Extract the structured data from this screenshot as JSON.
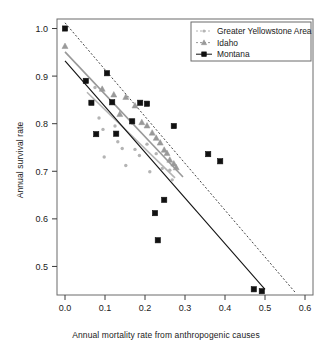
{
  "chart_data": {
    "type": "scatter",
    "title": "",
    "xlabel": "Annual mortality rate from anthropogenic causes",
    "ylabel": "Annual survival rate",
    "xlim": [
      -0.02,
      0.62
    ],
    "ylim": [
      0.44,
      1.02
    ],
    "xticks": [
      "0.0",
      "0.1",
      "0.2",
      "0.3",
      "0.4",
      "0.5",
      "0.6"
    ],
    "xtickvals": [
      0.0,
      0.1,
      0.2,
      0.3,
      0.4,
      0.5,
      0.6
    ],
    "yticks": [
      "0.5",
      "0.6",
      "0.7",
      "0.8",
      "0.9",
      "1.0"
    ],
    "ytickvals": [
      0.5,
      0.6,
      0.7,
      0.8,
      0.9,
      1.0
    ],
    "grid": false,
    "legend_position": "top-right",
    "series": [
      {
        "name": "Greater Yellowstone Area",
        "marker": "dot",
        "color": "#b4b4b4",
        "linestyle": "solid",
        "points": [
          {
            "x": 0.075,
            "y": 0.876
          },
          {
            "x": 0.085,
            "y": 0.812
          },
          {
            "x": 0.095,
            "y": 0.788
          },
          {
            "x": 0.098,
            "y": 0.73
          },
          {
            "x": 0.125,
            "y": 0.795
          },
          {
            "x": 0.132,
            "y": 0.762
          },
          {
            "x": 0.143,
            "y": 0.748
          },
          {
            "x": 0.152,
            "y": 0.712
          },
          {
            "x": 0.168,
            "y": 0.801
          },
          {
            "x": 0.175,
            "y": 0.746
          },
          {
            "x": 0.186,
            "y": 0.733
          },
          {
            "x": 0.205,
            "y": 0.757
          },
          {
            "x": 0.212,
            "y": 0.699
          },
          {
            "x": 0.228,
            "y": 0.737
          },
          {
            "x": 0.243,
            "y": 0.706
          },
          {
            "x": 0.262,
            "y": 0.702
          },
          {
            "x": 0.268,
            "y": 0.682
          }
        ],
        "fit": {
          "x0": 0.055,
          "y0": 0.866,
          "x1": 0.275,
          "y1": 0.686
        }
      },
      {
        "name": "Idaho",
        "marker": "triangle",
        "color": "#999999",
        "linestyle": "solid",
        "points": [
          {
            "x": 0.0,
            "y": 0.963
          },
          {
            "x": 0.093,
            "y": 0.873
          },
          {
            "x": 0.122,
            "y": 0.861
          },
          {
            "x": 0.137,
            "y": 0.82
          },
          {
            "x": 0.152,
            "y": 0.856
          },
          {
            "x": 0.175,
            "y": 0.838
          },
          {
            "x": 0.192,
            "y": 0.803
          },
          {
            "x": 0.205,
            "y": 0.796
          },
          {
            "x": 0.218,
            "y": 0.781
          },
          {
            "x": 0.228,
            "y": 0.77
          },
          {
            "x": 0.238,
            "y": 0.76
          },
          {
            "x": 0.248,
            "y": 0.745
          },
          {
            "x": 0.255,
            "y": 0.738
          },
          {
            "x": 0.262,
            "y": 0.724
          },
          {
            "x": 0.272,
            "y": 0.716
          },
          {
            "x": 0.278,
            "y": 0.708
          }
        ],
        "fit": {
          "x0": 0.0,
          "y0": 0.951,
          "x1": 0.295,
          "y1": 0.688
        }
      },
      {
        "name": "Montana",
        "marker": "square",
        "color": "#111111",
        "linestyle": "solid",
        "points": [
          {
            "x": 0.0,
            "y": 1.0
          },
          {
            "x": 0.052,
            "y": 0.89
          },
          {
            "x": 0.066,
            "y": 0.844
          },
          {
            "x": 0.078,
            "y": 0.778
          },
          {
            "x": 0.105,
            "y": 0.906
          },
          {
            "x": 0.118,
            "y": 0.845
          },
          {
            "x": 0.128,
            "y": 0.779
          },
          {
            "x": 0.168,
            "y": 0.805
          },
          {
            "x": 0.188,
            "y": 0.844
          },
          {
            "x": 0.205,
            "y": 0.842
          },
          {
            "x": 0.225,
            "y": 0.612
          },
          {
            "x": 0.232,
            "y": 0.555
          },
          {
            "x": 0.248,
            "y": 0.64
          },
          {
            "x": 0.272,
            "y": 0.795
          },
          {
            "x": 0.358,
            "y": 0.736
          },
          {
            "x": 0.388,
            "y": 0.721
          },
          {
            "x": 0.472,
            "y": 0.452
          },
          {
            "x": 0.492,
            "y": 0.448
          }
        ],
        "fit": {
          "x0": 0.0,
          "y0": 0.932,
          "x1": 0.5,
          "y1": 0.452
        }
      }
    ],
    "reference_line": {
      "name": "upper-dashed-reference",
      "color": "#444444",
      "linestyle": "dashed",
      "x0": 0.0,
      "y0": 1.012,
      "x1": 0.575,
      "y1": 0.446
    }
  },
  "legend": {
    "entries": [
      {
        "label": "Greater Yellowstone Area",
        "marker": "dot",
        "color": "#b4b4b4",
        "linestyle": "dashed"
      },
      {
        "label": "Idaho",
        "marker": "triangle",
        "color": "#999999",
        "linestyle": "dashed"
      },
      {
        "label": "Montana",
        "marker": "square",
        "color": "#111111",
        "linestyle": "solid"
      }
    ]
  }
}
